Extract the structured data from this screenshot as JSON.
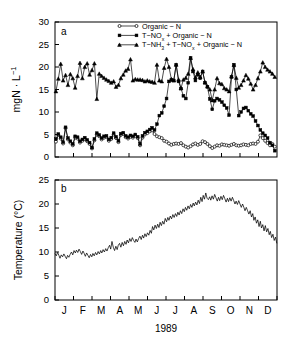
{
  "figure": {
    "panel_a_label": "a",
    "panel_b_label": "b",
    "xlabel": "1989"
  },
  "chart_data": [
    {
      "type": "line",
      "panel": "a",
      "title": "",
      "xlabel": "1989",
      "ylabel": "mgN · L⁻¹",
      "ylim": [
        0,
        30
      ],
      "yticks": [
        0,
        5,
        10,
        15,
        20,
        25,
        30
      ],
      "ytick_labels": [
        "0",
        "5",
        "10",
        "15",
        "20",
        "25",
        "30"
      ],
      "xlim": [
        0,
        12
      ],
      "xticks": [
        0,
        1,
        2,
        3,
        4,
        5,
        6,
        7,
        8,
        9,
        10,
        11,
        12
      ],
      "categories": [
        "J",
        "F",
        "M",
        "A",
        "M",
        "J",
        "J",
        "A",
        "S",
        "O",
        "N",
        "D"
      ],
      "grid": false,
      "legend_position": "top-center",
      "series": [
        {
          "name": "Organic − N",
          "marker": "circle-open",
          "x": [
            0.05,
            0.18,
            0.31,
            0.44,
            0.57,
            0.7,
            0.83,
            0.96,
            1.09,
            1.22,
            1.35,
            1.48,
            1.61,
            1.74,
            1.87,
            2.0,
            2.13,
            2.26,
            2.39,
            2.52,
            2.65,
            2.78,
            2.91,
            3.04,
            3.17,
            3.3,
            3.43,
            3.56,
            3.69,
            3.82,
            3.95,
            4.08,
            4.21,
            4.34,
            4.47,
            4.6,
            4.73,
            4.86,
            4.99,
            5.12,
            5.25,
            5.38,
            5.51,
            5.64,
            5.77,
            5.9,
            6.03,
            6.16,
            6.29,
            6.42,
            6.55,
            6.68,
            6.81,
            6.94,
            7.07,
            7.2,
            7.33,
            7.46,
            7.59,
            7.72,
            7.85,
            7.98,
            8.11,
            8.24,
            8.37,
            8.5,
            8.63,
            8.76,
            8.89,
            9.02,
            9.15,
            9.28,
            9.41,
            9.54,
            9.67,
            9.8,
            9.93,
            10.06,
            10.19,
            10.32,
            10.45,
            10.58,
            10.71,
            10.84,
            10.97,
            11.1,
            11.23,
            11.36,
            11.49,
            11.62,
            11.75,
            11.88
          ],
          "values": [
            3.4,
            4.9,
            4.1,
            3.0,
            6.4,
            3.9,
            3.2,
            2.6,
            4.3,
            4.1,
            3.2,
            3.6,
            4.0,
            3.5,
            2.9,
            1.9,
            3.7,
            5.0,
            4.6,
            3.9,
            4.3,
            4.4,
            3.6,
            4.0,
            5.0,
            4.2,
            3.3,
            4.9,
            5.1,
            4.4,
            4.1,
            4.5,
            4.3,
            4.7,
            4.2,
            2.6,
            4.3,
            5.0,
            5.3,
            5.7,
            5.9,
            5.1,
            4.6,
            4.4,
            4.2,
            3.6,
            3.4,
            3.0,
            2.7,
            2.9,
            3.0,
            2.9,
            3.1,
            2.6,
            2.3,
            2.1,
            2.4,
            2.8,
            3.0,
            2.7,
            2.9,
            3.5,
            3.3,
            2.9,
            2.4,
            2.0,
            2.3,
            2.6,
            2.5,
            2.8,
            2.7,
            2.6,
            2.5,
            2.7,
            2.9,
            2.6,
            2.5,
            2.6,
            2.8,
            2.7,
            2.6,
            2.9,
            3.0,
            2.9,
            3.4,
            4.8,
            4.2,
            3.6,
            3.1,
            2.6,
            2.9,
            2.3
          ]
        },
        {
          "name": "T−NOx + Organic − N",
          "marker": "square-filled",
          "x": [
            0.05,
            0.18,
            0.31,
            0.44,
            0.57,
            0.7,
            0.83,
            0.96,
            1.09,
            1.22,
            1.35,
            1.48,
            1.61,
            1.74,
            1.87,
            2.0,
            2.13,
            2.26,
            2.39,
            2.52,
            2.65,
            2.78,
            2.91,
            3.04,
            3.17,
            3.3,
            3.43,
            3.56,
            3.69,
            3.82,
            3.95,
            4.08,
            4.21,
            4.34,
            4.47,
            4.6,
            4.73,
            4.86,
            4.99,
            5.12,
            5.25,
            5.38,
            5.51,
            5.64,
            5.77,
            5.9,
            6.03,
            6.16,
            6.29,
            6.42,
            6.55,
            6.68,
            6.81,
            6.94,
            7.07,
            7.2,
            7.33,
            7.46,
            7.59,
            7.72,
            7.85,
            7.98,
            8.11,
            8.24,
            8.37,
            8.5,
            8.63,
            8.76,
            8.89,
            9.02,
            9.15,
            9.28,
            9.41,
            9.54,
            9.67,
            9.8,
            9.93,
            10.06,
            10.19,
            10.32,
            10.45,
            10.58,
            10.71,
            10.84,
            10.97,
            11.1,
            11.23,
            11.36,
            11.49,
            11.62,
            11.75,
            11.88
          ],
          "values": [
            4.0,
            5.1,
            4.4,
            3.3,
            6.6,
            4.2,
            3.5,
            2.9,
            4.6,
            4.4,
            3.5,
            3.9,
            4.3,
            3.8,
            3.2,
            2.1,
            4.0,
            5.3,
            4.9,
            4.2,
            4.6,
            4.7,
            3.9,
            4.3,
            5.3,
            4.5,
            3.6,
            5.2,
            5.4,
            4.7,
            4.4,
            4.8,
            4.6,
            5.0,
            4.5,
            2.9,
            4.7,
            5.4,
            5.7,
            6.1,
            6.5,
            6.0,
            7.3,
            9.2,
            9.8,
            11.3,
            13.0,
            16.8,
            17.1,
            17.0,
            20.5,
            16.8,
            15.2,
            13.6,
            13.0,
            16.5,
            22.0,
            19.0,
            17.0,
            18.3,
            17.5,
            19.0,
            16.5,
            15.6,
            12.9,
            10.6,
            12.5,
            13.0,
            12.7,
            12.2,
            11.5,
            10.9,
            9.3,
            17.8,
            20.5,
            15.0,
            9.2,
            10.0,
            10.8,
            11.0,
            10.3,
            9.6,
            9.1,
            8.0,
            7.0,
            6.0,
            5.3,
            4.8,
            4.2,
            3.2,
            2.6,
            1.4
          ]
        },
        {
          "name": "T−NH3 + T−NOx + Organic − N",
          "marker": "triangle-filled",
          "x": [
            0.05,
            0.18,
            0.31,
            0.44,
            0.57,
            0.7,
            0.83,
            0.96,
            1.09,
            1.22,
            1.35,
            1.48,
            1.61,
            1.74,
            1.87,
            2.0,
            2.13,
            2.26,
            2.39,
            2.52,
            2.65,
            2.78,
            2.91,
            3.04,
            3.17,
            3.3,
            3.43,
            3.56,
            3.69,
            3.82,
            3.95,
            4.08,
            4.21,
            4.34,
            4.47,
            4.6,
            4.73,
            4.86,
            4.99,
            5.12,
            5.25,
            5.38,
            5.51,
            5.64,
            5.77,
            5.9,
            6.03,
            6.16,
            6.29,
            6.42,
            6.55,
            6.68,
            6.81,
            6.94,
            7.07,
            7.2,
            7.33,
            7.46,
            7.59,
            7.72,
            7.85,
            7.98,
            8.11,
            8.24,
            8.37,
            8.5,
            8.63,
            8.76,
            8.89,
            9.02,
            9.15,
            9.28,
            9.41,
            9.54,
            9.67,
            9.8,
            9.93,
            10.06,
            10.19,
            10.32,
            10.45,
            10.58,
            10.71,
            10.84,
            10.97,
            11.1,
            11.23,
            11.36,
            11.49,
            11.62,
            11.75,
            11.88
          ],
          "values": [
            14.6,
            17.4,
            20.7,
            17.0,
            18.2,
            16.0,
            18.4,
            17.5,
            15.4,
            18.0,
            20.9,
            17.5,
            20.0,
            20.8,
            18.3,
            19.3,
            20.8,
            12.9,
            18.5,
            18.0,
            17.6,
            17.2,
            16.9,
            16.5,
            16.8,
            15.6,
            16.0,
            17.5,
            18.3,
            19.2,
            19.6,
            21.7,
            17.0,
            17.3,
            17.2,
            17.2,
            17.1,
            16.8,
            17.0,
            16.8,
            16.7,
            16.5,
            20.5,
            17.0,
            16.8,
            19.8,
            21.8,
            20.0,
            17.3,
            17.0,
            20.5,
            17.2,
            15.3,
            17.2,
            17.6,
            18.5,
            22.0,
            19.5,
            17.7,
            18.8,
            17.8,
            19.0,
            16.6,
            15.7,
            15.0,
            12.6,
            15.0,
            17.5,
            16.4,
            16.2,
            15.3,
            15.0,
            14.6,
            17.9,
            20.4,
            17.6,
            15.4,
            16.0,
            17.0,
            18.2,
            17.4,
            16.3,
            15.0,
            16.0,
            17.5,
            19.0,
            21.0,
            20.0,
            19.4,
            19.0,
            18.5,
            17.8
          ]
        }
      ]
    },
    {
      "type": "line",
      "panel": "b",
      "title": "",
      "xlabel": "1989",
      "ylabel": "Temperature (°C)",
      "ylim": [
        0,
        25
      ],
      "yticks": [
        0,
        5,
        10,
        15,
        20,
        25
      ],
      "ytick_labels": [
        "0",
        "5",
        "10",
        "15",
        "20",
        "25"
      ],
      "xlim": [
        0,
        12
      ],
      "xticks": [
        0,
        1,
        2,
        3,
        4,
        5,
        6,
        7,
        8,
        9,
        10,
        11,
        12
      ],
      "categories": [
        "J",
        "F",
        "M",
        "A",
        "M",
        "J",
        "J",
        "A",
        "S",
        "O",
        "N",
        "D"
      ],
      "grid": false,
      "series": [
        {
          "name": "Temperature",
          "marker": "none",
          "x": [
            0.0,
            0.07,
            0.14,
            0.21,
            0.27,
            0.34,
            0.41,
            0.48,
            0.55,
            0.62,
            0.68,
            0.75,
            0.82,
            0.89,
            0.96,
            1.03,
            1.1,
            1.16,
            1.23,
            1.3,
            1.37,
            1.44,
            1.51,
            1.58,
            1.64,
            1.71,
            1.78,
            1.85,
            1.92,
            1.99,
            2.05,
            2.12,
            2.19,
            2.26,
            2.33,
            2.4,
            2.47,
            2.53,
            2.6,
            2.67,
            2.74,
            2.81,
            2.88,
            2.95,
            3.01,
            3.08,
            3.15,
            3.22,
            3.29,
            3.36,
            3.42,
            3.49,
            3.56,
            3.63,
            3.7,
            3.77,
            3.84,
            3.9,
            3.97,
            4.04,
            4.11,
            4.18,
            4.25,
            4.32,
            4.38,
            4.45,
            4.52,
            4.59,
            4.66,
            4.73,
            4.79,
            4.86,
            4.93,
            5.0,
            5.07,
            5.14,
            5.21,
            5.27,
            5.34,
            5.41,
            5.48,
            5.55,
            5.62,
            5.68,
            5.75,
            5.82,
            5.89,
            5.96,
            6.03,
            6.1,
            6.16,
            6.23,
            6.3,
            6.37,
            6.44,
            6.51,
            6.58,
            6.64,
            6.71,
            6.78,
            6.85,
            6.92,
            6.99,
            7.05,
            7.12,
            7.19,
            7.26,
            7.33,
            7.4,
            7.47,
            7.53,
            7.6,
            7.67,
            7.74,
            7.81,
            7.88,
            7.95,
            8.01,
            8.08,
            8.15,
            8.22,
            8.29,
            8.36,
            8.42,
            8.49,
            8.56,
            8.63,
            8.7,
            8.77,
            8.84,
            8.9,
            8.97,
            9.04,
            9.11,
            9.18,
            9.25,
            9.32,
            9.38,
            9.45,
            9.52,
            9.59,
            9.66,
            9.73,
            9.79,
            9.86,
            9.93,
            10.0,
            10.07,
            10.14,
            10.21,
            10.27,
            10.34,
            10.41,
            10.48,
            10.55,
            10.62,
            10.69,
            10.75,
            10.82,
            10.89,
            10.96,
            11.03,
            11.1,
            11.16,
            11.23,
            11.3,
            11.37,
            11.44,
            11.51,
            11.58,
            11.64,
            11.71,
            11.78,
            11.85,
            11.92,
            11.99
          ],
          "values": [
            9.7,
            9.2,
            9.9,
            9.3,
            8.7,
            9.4,
            9.0,
            9.6,
            9.1,
            8.6,
            9.3,
            8.9,
            9.5,
            10.0,
            9.4,
            10.3,
            9.8,
            10.4,
            9.9,
            10.6,
            10.1,
            9.5,
            10.2,
            9.7,
            9.1,
            9.8,
            9.3,
            8.8,
            9.5,
            9.0,
            9.7,
            9.2,
            9.9,
            9.4,
            10.1,
            9.6,
            10.3,
            9.8,
            10.5,
            10.0,
            10.7,
            10.2,
            10.9,
            11.4,
            10.6,
            12.2,
            11.0,
            10.3,
            11.2,
            10.5,
            11.4,
            11.8,
            11.0,
            12.0,
            11.3,
            12.2,
            11.6,
            12.5,
            11.9,
            12.8,
            12.2,
            13.0,
            12.4,
            12.0,
            12.7,
            12.1,
            12.8,
            13.3,
            12.6,
            13.5,
            12.9,
            13.8,
            13.2,
            14.0,
            13.5,
            14.5,
            13.9,
            15.3,
            14.6,
            15.6,
            14.9,
            15.8,
            15.1,
            16.2,
            15.5,
            16.4,
            15.8,
            17.0,
            16.3,
            17.2,
            16.6,
            17.5,
            16.9,
            17.8,
            17.2,
            18.0,
            17.4,
            18.3,
            17.7,
            18.6,
            18.0,
            19.0,
            18.4,
            19.3,
            18.7,
            19.6,
            19.0,
            19.9,
            19.3,
            20.2,
            19.6,
            20.4,
            19.8,
            20.8,
            20.1,
            21.4,
            20.5,
            21.8,
            21.0,
            22.3,
            21.2,
            20.9,
            21.5,
            20.8,
            21.7,
            21.0,
            22.0,
            21.3,
            20.6,
            21.4,
            20.7,
            21.6,
            20.9,
            21.8,
            21.1,
            20.4,
            21.2,
            20.5,
            21.3,
            20.6,
            21.4,
            20.7,
            20.0,
            20.6,
            19.9,
            20.7,
            20.0,
            19.3,
            20.0,
            19.3,
            18.6,
            19.3,
            18.6,
            17.9,
            18.6,
            17.3,
            18.0,
            16.6,
            17.3,
            16.0,
            16.7,
            15.3,
            16.4,
            15.0,
            15.7,
            14.4,
            15.5,
            14.2,
            14.9,
            13.6,
            14.3,
            13.0,
            13.7,
            12.4,
            13.1,
            11.8,
            12.5,
            11.2,
            11.9,
            10.6,
            11.3,
            10.2,
            10.9,
            10.3,
            9.8,
            10.2,
            9.6
          ]
        }
      ]
    }
  ],
  "legend": {
    "items": [
      {
        "marker": "circle-open",
        "text": "Organic − N"
      },
      {
        "marker": "square-filled",
        "text_pre": "T−NO",
        "sub": "x",
        "text_post": " + Organic − N"
      },
      {
        "marker": "triangle-filled",
        "text_pre": "T−NH",
        "sub": "3",
        "text_mid": " + T−NO",
        "sub2": "x",
        "text_post": " + Organic − N"
      }
    ]
  },
  "colors": {
    "axis": "#000000",
    "line": "#000000",
    "background": "#ffffff"
  }
}
